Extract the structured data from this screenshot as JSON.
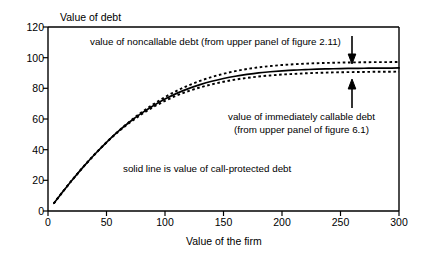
{
  "chart_data": {
    "type": "line",
    "title": "",
    "ylabel": "Value of debt",
    "xlabel": "Value of the firm",
    "xlim": [
      0,
      300
    ],
    "ylim": [
      0,
      120
    ],
    "xticks": [
      "0",
      "50",
      "100",
      "150",
      "200",
      "250",
      "300"
    ],
    "yticks": [
      "0",
      "20",
      "40",
      "60",
      "80",
      "100",
      "120"
    ],
    "grid": false,
    "legend_position": "inline-annotations",
    "series": [
      {
        "name": "value of noncallable debt",
        "style": "dotted",
        "x": [
          5,
          10,
          20,
          30,
          40,
          50,
          60,
          70,
          80,
          90,
          100,
          110,
          120,
          130,
          140,
          150,
          160,
          170,
          180,
          190,
          200,
          210,
          220,
          230,
          240,
          250,
          260,
          270,
          280,
          290,
          300
        ],
        "y": [
          5.0,
          10.0,
          19.6,
          28.6,
          37.0,
          44.8,
          52.0,
          58.5,
          64.4,
          69.6,
          74.3,
          78.4,
          81.9,
          84.9,
          87.4,
          89.5,
          91.2,
          92.6,
          93.7,
          94.5,
          95.2,
          95.7,
          96.1,
          96.4,
          96.6,
          96.8,
          96.9,
          97.0,
          97.1,
          97.1,
          97.2
        ]
      },
      {
        "name": "value of call-protected debt",
        "style": "solid",
        "x": [
          5,
          10,
          20,
          30,
          40,
          50,
          60,
          70,
          80,
          90,
          100,
          110,
          120,
          130,
          140,
          150,
          160,
          170,
          180,
          190,
          200,
          210,
          220,
          230,
          240,
          250,
          260,
          270,
          280,
          290,
          300
        ],
        "y": [
          5.0,
          10.0,
          19.6,
          28.6,
          37.0,
          44.8,
          51.9,
          58.2,
          63.8,
          68.7,
          73.0,
          76.7,
          79.8,
          82.4,
          84.6,
          86.4,
          87.9,
          89.1,
          90.1,
          90.8,
          91.4,
          91.9,
          92.2,
          92.5,
          92.7,
          92.9,
          93.0,
          93.1,
          93.2,
          93.2,
          93.3
        ]
      },
      {
        "name": "value of immediately callable debt",
        "style": "dotted",
        "x": [
          5,
          10,
          20,
          30,
          40,
          50,
          60,
          70,
          80,
          90,
          100,
          110,
          120,
          130,
          140,
          150,
          160,
          170,
          180,
          190,
          200,
          210,
          220,
          230,
          240,
          250,
          260,
          270,
          280,
          290,
          300
        ],
        "y": [
          5.0,
          10.0,
          19.6,
          28.6,
          37.0,
          44.7,
          51.6,
          57.7,
          63.1,
          67.8,
          71.8,
          75.3,
          78.2,
          80.6,
          82.6,
          84.3,
          85.7,
          86.8,
          87.7,
          88.4,
          89.0,
          89.4,
          89.8,
          90.1,
          90.3,
          90.5,
          90.6,
          90.7,
          90.8,
          90.8,
          90.9
        ]
      }
    ],
    "annotations": [
      {
        "id": "noncallable",
        "text": "value of noncallable debt (from upper panel of figure 2.11)",
        "arrow": "down"
      },
      {
        "id": "callable",
        "line1": "value of immediately callable debt",
        "line2": "(from upper panel of figure 6.1)",
        "arrow": "up"
      },
      {
        "id": "solid",
        "text": "solid line is value of call-protected debt",
        "arrow": "none"
      }
    ]
  },
  "axis": {
    "y_title": "Value of debt",
    "x_title": "Value of the firm",
    "y_ticks": [
      "120",
      "100",
      "80",
      "60",
      "40",
      "20",
      "0"
    ],
    "x_ticks": [
      "0",
      "50",
      "100",
      "150",
      "200",
      "250",
      "300"
    ]
  },
  "annotations": {
    "noncallable": "value of noncallable debt (from upper panel of figure 2.11)",
    "callable_line1": "value of immediately callable debt",
    "callable_line2": "(from upper panel of figure 6.1)",
    "solid": "solid line is value of call-protected debt"
  },
  "colors": {
    "axis": "#000000",
    "curve": "#000000",
    "background": "#ffffff"
  }
}
